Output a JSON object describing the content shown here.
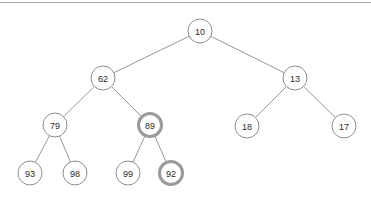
{
  "diagram": {
    "background_color": "#ffffff",
    "stroke_color": "#8c8c8c",
    "highlight_stroke_color": "#9a9a9a",
    "text_color": "#2b2b2b",
    "top_rule_color": "#a9a9a9"
  },
  "chart_data": {
    "type": "diagram",
    "subtype": "binary-tree",
    "title": "",
    "nodes": [
      {
        "id": "n10",
        "label": "10",
        "x": 200,
        "y": 31,
        "r": 12,
        "depth": 0,
        "highlight": false
      },
      {
        "id": "n62",
        "label": "62",
        "x": 103,
        "y": 78,
        "r": 12,
        "depth": 1,
        "highlight": false
      },
      {
        "id": "n13",
        "label": "13",
        "x": 295,
        "y": 78,
        "r": 12,
        "depth": 1,
        "highlight": false
      },
      {
        "id": "n79",
        "label": "79",
        "x": 55,
        "y": 125,
        "r": 12,
        "depth": 2,
        "highlight": false
      },
      {
        "id": "n89",
        "label": "89",
        "x": 150,
        "y": 125,
        "r": 11.5,
        "depth": 2,
        "highlight": true
      },
      {
        "id": "n18",
        "label": "18",
        "x": 247,
        "y": 126,
        "r": 12,
        "depth": 2,
        "highlight": false
      },
      {
        "id": "n17",
        "label": "17",
        "x": 344,
        "y": 126,
        "r": 12,
        "depth": 2,
        "highlight": false
      },
      {
        "id": "n93",
        "label": "93",
        "x": 30,
        "y": 173,
        "r": 12,
        "depth": 3,
        "highlight": false
      },
      {
        "id": "n98",
        "label": "98",
        "x": 75,
        "y": 173,
        "r": 12,
        "depth": 3,
        "highlight": false
      },
      {
        "id": "n99",
        "label": "99",
        "x": 128,
        "y": 173,
        "r": 12,
        "depth": 3,
        "highlight": false
      },
      {
        "id": "n92",
        "label": "92",
        "x": 171,
        "y": 173,
        "r": 11.5,
        "depth": 3,
        "highlight": true
      }
    ],
    "edges": [
      {
        "from": "n10",
        "to": "n62"
      },
      {
        "from": "n10",
        "to": "n13"
      },
      {
        "from": "n62",
        "to": "n79"
      },
      {
        "from": "n62",
        "to": "n89"
      },
      {
        "from": "n13",
        "to": "n18"
      },
      {
        "from": "n13",
        "to": "n17"
      },
      {
        "from": "n79",
        "to": "n93"
      },
      {
        "from": "n79",
        "to": "n98"
      },
      {
        "from": "n89",
        "to": "n99"
      },
      {
        "from": "n89",
        "to": "n92"
      }
    ],
    "highlighted_nodes": [
      "89",
      "92"
    ]
  }
}
